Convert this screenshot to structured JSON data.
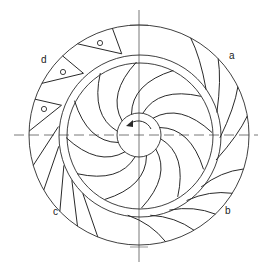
{
  "diagram": {
    "center": {
      "x": 139,
      "y": 135
    },
    "outer_radius": 110,
    "ring_outer_radius": 81,
    "ring_inner_radius": 73,
    "hub_radius": 22,
    "stroke_color": "#2a2a2a",
    "centerline_color": "#555555",
    "impeller_blade_count": 12,
    "rotation_indicator": "counterclockwise-arrow",
    "labels": [
      {
        "id": "a",
        "text": "a",
        "x": 229,
        "y": 56
      },
      {
        "id": "b",
        "text": "b",
        "x": 225,
        "y": 211
      },
      {
        "id": "c",
        "text": "c",
        "x": 53,
        "y": 212
      },
      {
        "id": "d",
        "text": "d",
        "x": 41,
        "y": 60
      }
    ],
    "sectors": {
      "a": "curved diffuser vanes (upper right)",
      "b": "curved short vanes (lower right)",
      "c": "straight vanes (lower left)",
      "d": "wedge vanes with holes (upper left)"
    },
    "hole_markers": [
      {
        "x": 100,
        "y": 43
      },
      {
        "x": 63,
        "y": 72
      },
      {
        "x": 44,
        "y": 109
      }
    ]
  }
}
